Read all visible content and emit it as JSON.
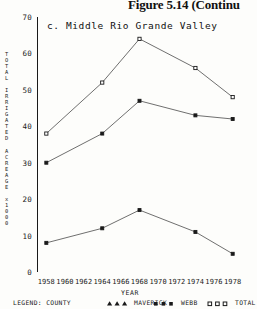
{
  "figure": {
    "caption": "Figure 5.14 (Continu"
  },
  "panel": {
    "title": "c. Middle Rio Grande Valley"
  },
  "axes": {
    "y_caption_lines": [
      "T",
      "O",
      "T",
      "A",
      "L",
      "",
      "I",
      "R",
      "R",
      "I",
      "G",
      "A",
      "T",
      "E",
      "D",
      "",
      "A",
      "C",
      "R",
      "E",
      "A",
      "G",
      "E",
      "",
      "x",
      "1",
      "0",
      "0",
      "0"
    ],
    "y_caption_text": "TOTAL IRRIGATED ACREAGE x 1000",
    "y_ticks": [
      "0",
      "10",
      "20",
      "30",
      "40",
      "50",
      "60",
      "70"
    ],
    "x_caption": "YEAR",
    "x_ticks": [
      "1958",
      "1960",
      "1962",
      "1964",
      "1966",
      "1968",
      "1970",
      "1972",
      "1974",
      "1976",
      "1978"
    ]
  },
  "legend": {
    "title": "LEGEND: COUNTY",
    "entries": [
      {
        "label": "MAVERICK",
        "marker": "triangle-marker"
      },
      {
        "label": "WEBB",
        "marker": "square-marker"
      },
      {
        "label": "TOTAL",
        "marker": "open-square-marker"
      }
    ]
  },
  "chart_data": {
    "type": "line",
    "title": "c. Middle Rio Grande Valley",
    "xlabel": "YEAR",
    "ylabel": "TOTAL IRRIGATED ACREAGE x 1000",
    "xlim": [
      1957,
      1979
    ],
    "ylim": [
      0,
      70
    ],
    "yticks": [
      0,
      10,
      20,
      30,
      40,
      50,
      60,
      70
    ],
    "xticks": [
      1958,
      1960,
      1962,
      1964,
      1966,
      1968,
      1970,
      1972,
      1974,
      1976,
      1978
    ],
    "grid": false,
    "legend_position": "bottom",
    "x": [
      1958,
      1964,
      1968,
      1974,
      1978
    ],
    "series": [
      {
        "name": "TOTAL",
        "values": [
          38,
          52,
          64,
          56,
          48
        ]
      },
      {
        "name": "WEBB",
        "values": [
          30,
          38,
          47,
          43,
          42
        ]
      },
      {
        "name": "MAVERICK",
        "values": [
          8,
          12,
          17,
          11,
          5
        ]
      }
    ]
  }
}
